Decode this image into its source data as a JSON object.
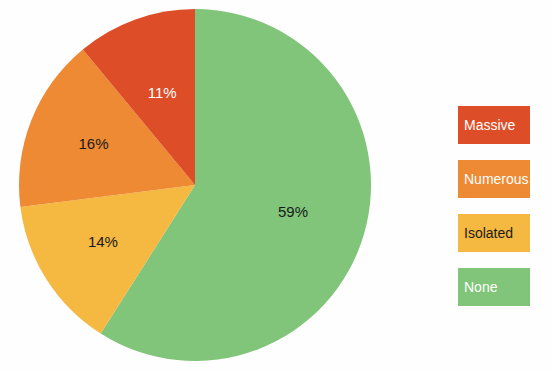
{
  "chart_data": {
    "type": "pie",
    "title": "",
    "labels": [
      "None",
      "Isolated",
      "Numerous",
      "Massive"
    ],
    "values": [
      59,
      14,
      16,
      11
    ],
    "value_labels": [
      "59%",
      "14%",
      "16%",
      "11%"
    ],
    "colors": [
      "#80c579",
      "#f5b841",
      "#ed8a33",
      "#dd4d28"
    ],
    "label_text_colors": [
      "#1a1a1a",
      "#1a1a1a",
      "#1a1a1a",
      "#ffffff"
    ],
    "units": "percent",
    "start_angle_deg": 0,
    "direction": "clockwise",
    "legend_position": "right",
    "legend": [
      {
        "label": "Massive",
        "color": "#dd4d28",
        "text_color": "#ffffff"
      },
      {
        "label": "Numerous",
        "color": "#ed8a33",
        "text_color": "#ffffff"
      },
      {
        "label": "Isolated",
        "color": "#f5b841",
        "text_color": "#1a1a1a"
      },
      {
        "label": "None",
        "color": "#80c579",
        "text_color": "#ffffff"
      }
    ]
  },
  "slice_labels": {
    "none": "59%",
    "isolated": "14%",
    "numerous": "16%",
    "massive": "11%"
  },
  "legend_labels": {
    "massive": "Massive",
    "numerous": "Numerous",
    "isolated": "Isolated",
    "none": "None"
  },
  "colors": {
    "background": "#fefefe",
    "green": "#80c579",
    "yellow": "#f5b841",
    "orange": "#ed8a33",
    "red": "#dd4d28"
  }
}
